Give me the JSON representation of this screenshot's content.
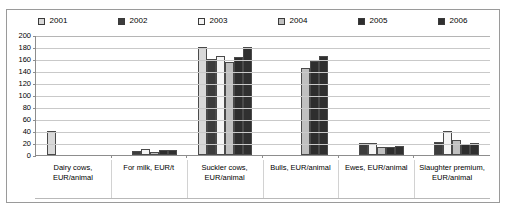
{
  "chart_data": {
    "type": "bar",
    "title": "",
    "xlabel": "",
    "ylabel": "",
    "ylim": [
      0,
      200
    ],
    "ytick_step": 20,
    "yticks": [
      "200",
      "180",
      "160",
      "140",
      "120",
      "100",
      "80",
      "60",
      "40",
      "20",
      "0"
    ],
    "grid": true,
    "legend_position": "top",
    "categories": [
      "Dairy cows, EUR/animal",
      "For milk, EUR/t",
      "Suckler cows, EUR/animal",
      "Bulls, EUR/animal",
      "Ewes, EUR/animal",
      "Slaughter premium, EUR/animal"
    ],
    "series": [
      {
        "name": "2001",
        "color": "#d9d9d9",
        "values": [
          40,
          null,
          180,
          null,
          null,
          null
        ]
      },
      {
        "name": "2002",
        "color": "#3d3d3d",
        "values": [
          null,
          6,
          160,
          null,
          20,
          22
        ]
      },
      {
        "name": "2003",
        "color": "#f5f5f5",
        "values": [
          null,
          10,
          165,
          null,
          20,
          40
        ]
      },
      {
        "name": "2004",
        "color": "#c0c0c0",
        "values": [
          null,
          5,
          155,
          145,
          14,
          25
        ]
      },
      {
        "name": "2005",
        "color": "#2e2e2e",
        "values": [
          null,
          8,
          163,
          157,
          14,
          19
        ]
      },
      {
        "name": "2006",
        "color": "#303030",
        "values": [
          null,
          8,
          180,
          165,
          15,
          20
        ]
      }
    ]
  },
  "legend": {
    "items": [
      {
        "label": "2001",
        "color": "#d9d9d9"
      },
      {
        "label": "2002",
        "color": "#3d3d3d"
      },
      {
        "label": "2003",
        "color": "#f5f5f5"
      },
      {
        "label": "2004",
        "color": "#c0c0c0"
      },
      {
        "label": "2005",
        "color": "#2e2e2e"
      },
      {
        "label": "2006",
        "color": "#303030"
      }
    ]
  },
  "axis": {
    "y_ticks": [
      "200",
      "180",
      "160",
      "140",
      "120",
      "100",
      "80",
      "60",
      "40",
      "20",
      "0"
    ]
  },
  "x_axis": {
    "labels": [
      "Dairy cows, EUR/animal",
      "For milk, EUR/t",
      "Suckler cows, EUR/animal",
      "Bulls, EUR/animal",
      "Ewes, EUR/animal",
      "Slaughter premium, EUR/animal"
    ]
  }
}
